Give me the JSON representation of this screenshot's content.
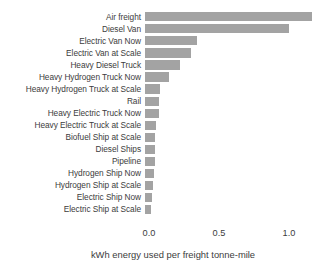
{
  "chart_data": {
    "type": "bar",
    "orientation": "horizontal",
    "title": "",
    "xlabel": "kWh energy used per freight tonne-mile",
    "ylabel": "",
    "xlim": [
      0.0,
      1.25
    ],
    "xticks": [
      "0.0",
      "0.5",
      "1.0"
    ],
    "xtick_values": [
      0.0,
      0.5,
      1.0
    ],
    "grid": false,
    "legend": null,
    "bar_color": "#a3a3a3",
    "background_color": "#ffffff",
    "categories": [
      "Air freight",
      "Diesel Van",
      "Electric Van Now",
      "Electric Van at Scale",
      "Heavy Diesel Truck",
      "Heavy Hydrogen Truck Now",
      "Heavy Hydrogen Truck at Scale",
      "Rail",
      "Heavy Electric Truck Now",
      "Heavy Electric Truck at Scale",
      "Biofuel Ship at Scale",
      "Diesel Ships",
      "Pipeline",
      "Hydrogen Ship Now",
      "Hydrogen Ship at Scale",
      "Electric Ship Now",
      "Electric Ship at Scale"
    ],
    "values": [
      1.19,
      1.03,
      0.37,
      0.33,
      0.25,
      0.17,
      0.11,
      0.1,
      0.1,
      0.075,
      0.07,
      0.07,
      0.07,
      0.065,
      0.055,
      0.05,
      0.045
    ]
  }
}
